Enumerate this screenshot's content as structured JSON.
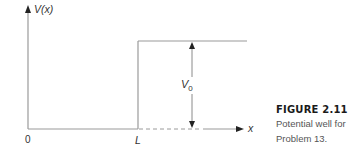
{
  "diagram": {
    "y_axis_label_base": "V",
    "y_axis_label_arg": "(x)",
    "x_axis_label": "x",
    "origin_label": "0",
    "step_label": "L",
    "height_label_base": "V",
    "height_label_sub": "0"
  },
  "caption": {
    "title": "FIGURE 2.11",
    "line1": "Potential well for",
    "line2": "Problem 13."
  },
  "colors": {
    "line": "#8a8a8a",
    "arrow": "#222222",
    "text": "#333333"
  }
}
